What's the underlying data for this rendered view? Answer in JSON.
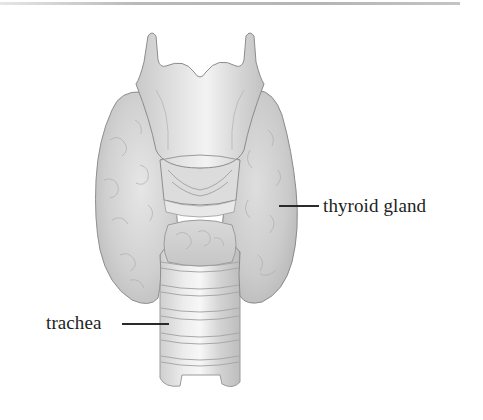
{
  "figure": {
    "labels": [
      {
        "id": "thyroid",
        "text": "thyroid gland"
      },
      {
        "id": "trachea",
        "text": "trachea"
      }
    ]
  },
  "colors": {
    "label_text": "#1e1e1e",
    "leader_line": "#2a2a2a",
    "illustration_base": "#d4d4d4",
    "illustration_outline": "#8a8a8a",
    "top_rule": "#b9b9b9",
    "background": "#ffffff"
  }
}
